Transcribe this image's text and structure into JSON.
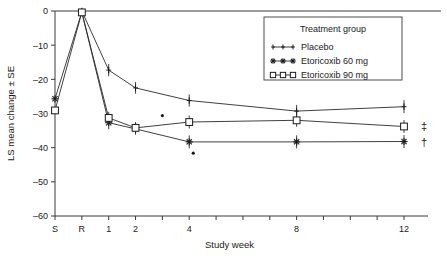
{
  "chart_data": {
    "type": "line",
    "title": "",
    "xlabel": "Study week",
    "ylabel": "LS mean change ± SE",
    "ylim": [
      -60,
      0
    ],
    "yticks": [
      0,
      -10,
      -20,
      -30,
      -40,
      -50,
      -60
    ],
    "ytick_labels": [
      "0",
      "–10",
      "–20",
      "–30",
      "–40",
      "–50",
      "–60"
    ],
    "categories": [
      "S",
      "R",
      "1",
      "2",
      "3",
      "4",
      "5",
      "6",
      "7",
      "8",
      "9",
      "10",
      "11",
      "12"
    ],
    "xtick_labels": [
      "S",
      "R",
      "1",
      "2",
      "",
      "4",
      "",
      "",
      "",
      "8",
      "",
      "",
      "",
      "12"
    ],
    "grid": false,
    "legend_position": "top-right",
    "legend_title": "Treatment group",
    "series": [
      {
        "name": "Placebo",
        "marker": "vertical-tick",
        "x": [
          "R",
          "1",
          "2",
          "4",
          "8",
          "12"
        ],
        "values": [
          0.0,
          -17.3,
          -22.5,
          -26.2,
          -29.3,
          -28.0
        ],
        "errors": [
          0.6,
          1.8,
          1.7,
          1.8,
          1.8,
          1.9
        ]
      },
      {
        "name": "Etoricoxib 60 mg",
        "marker": "cross",
        "x": [
          "S",
          "R",
          "1",
          "2",
          "4",
          "8",
          "12"
        ],
        "values": [
          -25.7,
          -0.3,
          -32.7,
          -34.5,
          -38.3,
          -38.3,
          -38.2
        ],
        "errors": [
          0.0,
          0.6,
          1.9,
          1.7,
          1.9,
          1.9,
          1.9
        ]
      },
      {
        "name": "Etoricoxib 90 mg",
        "marker": "open-square",
        "x": [
          "S",
          "R",
          "1",
          "2",
          "4",
          "8",
          "12"
        ],
        "values": [
          -29.1,
          -0.4,
          -31.3,
          -34.2,
          -32.5,
          -32.0,
          -33.8
        ],
        "errors": [
          0.0,
          0.6,
          1.8,
          1.7,
          1.9,
          1.9,
          1.9
        ]
      }
    ],
    "annotations": [
      {
        "name": "stray-dot-1",
        "x": 3.0,
        "y": -30.6
      },
      {
        "name": "stray-dot-2",
        "x": 4.15,
        "y": -41.6
      }
    ],
    "margin_markers": [
      {
        "name": "double-dagger",
        "symbol": "‡",
        "y": -33.8
      },
      {
        "name": "dagger",
        "symbol": "†",
        "y": -38.2
      }
    ]
  },
  "legend": {
    "title": "Treatment group",
    "entries": [
      {
        "label": "Placebo",
        "marker": "vertical-tick"
      },
      {
        "label": "Etoricoxib 60 mg",
        "marker": "cross"
      },
      {
        "label": "Etoricoxib 90 mg",
        "marker": "open-square"
      }
    ]
  },
  "colors": {
    "ink": "#1a1a1a",
    "axis": "#3a3a3a",
    "background": "#ffffff"
  }
}
